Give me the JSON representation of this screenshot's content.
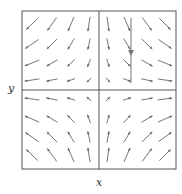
{
  "figure": {
    "type": "vector-field",
    "x_label": "x",
    "y_label": "y",
    "frame": {
      "left": 22,
      "top": 11,
      "right": 176,
      "bottom": 169
    },
    "axes_origin": {
      "x": 99,
      "y": 90
    },
    "colors": {
      "arrow": "#666666",
      "frame": "#555555",
      "axis": "#555555",
      "highlight_arrow": "#777777"
    },
    "grid": {
      "cols": [
        32,
        52,
        71,
        89,
        108,
        127,
        147,
        165
      ],
      "rows": [
        24,
        44,
        63,
        80,
        99,
        119,
        137,
        155
      ]
    },
    "field_description": "saddle field (x, -y): arrows flow toward the x-axis vertically and away from the y-axis horizontally",
    "highlight_arrow": {
      "x": 131,
      "y1": 18,
      "y2": 83,
      "head_y": 55,
      "direction": "down"
    }
  }
}
